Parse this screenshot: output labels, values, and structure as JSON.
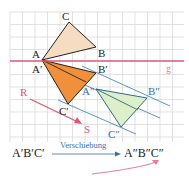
{
  "diagram": {
    "grid": {
      "x0": 10,
      "y0": 12,
      "x1": 184,
      "y1": 142,
      "step": 12.5,
      "color": "#d6d6d6"
    },
    "mirror_line": {
      "label": "g",
      "y": 61,
      "color": "#e0557a"
    },
    "triangle_original": {
      "labels": {
        "A": "A",
        "B": "B",
        "C": "C"
      },
      "fill": "#f6dcc0",
      "points": {
        "A": [
          42,
          60
        ],
        "B": [
          96,
          47
        ],
        "C": [
          69,
          22
        ]
      }
    },
    "triangle_reflected": {
      "labels": {
        "A": "A′",
        "B": "B′",
        "C": "C′"
      },
      "fill": "#f0903a",
      "points": {
        "A": [
          42,
          60
        ],
        "B": [
          96,
          73
        ],
        "C": [
          68,
          104
        ]
      }
    },
    "triangle_translated": {
      "labels": {
        "A": "A″",
        "B": "B″",
        "C": "C″"
      },
      "fill": "#dcefc8",
      "points": {
        "A": [
          96,
          89
        ],
        "B": [
          147,
          98
        ],
        "C": [
          121,
          127
        ]
      }
    },
    "translation_vector": {
      "start_label": "R",
      "end_label": "S",
      "color": "#e0557a",
      "start": [
        30,
        99
      ],
      "end": [
        82,
        124
      ]
    },
    "caption": {
      "left": "A′B′C′",
      "arrow_label": "Verschiebung",
      "right": "A″B″C″"
    },
    "colors": {
      "parallel_lines": "#4a86c2",
      "curved_arrow": "#e87a9a"
    }
  }
}
